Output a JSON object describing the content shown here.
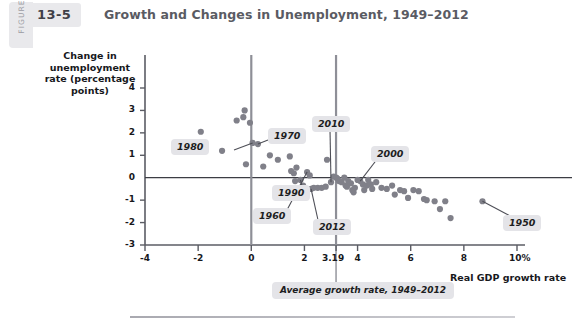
{
  "header": {
    "figure_word": "FIGURE",
    "figure_number": "13-5",
    "title": "Growth and Changes in Unemployment, 1949–2012"
  },
  "chart_data": {
    "type": "scatter",
    "title": "Growth and Changes in Unemployment, 1949–2012",
    "xlabel": "Real GDP growth rate",
    "ylabel": "Change in unemployment rate (percentage points)",
    "xlim": [
      -4,
      10
    ],
    "ylim": [
      -3,
      4.4
    ],
    "grid": false,
    "legend": "none",
    "xticks": [
      "-4",
      "-2",
      "0",
      "2",
      "3.19",
      "4",
      "6",
      "8",
      "10%"
    ],
    "xtick_values": [
      -4,
      -2,
      0,
      2,
      3.19,
      4,
      6,
      8,
      10
    ],
    "yticks": [
      "4",
      "3",
      "2",
      "1",
      "0",
      "-1",
      "-2",
      "-3"
    ],
    "ytick_values": [
      4,
      3,
      2,
      1,
      0,
      -1,
      -2,
      -3
    ],
    "point_color": "#808089",
    "reference_lines": [
      {
        "name": "zero-unemployment-change",
        "orientation": "horizontal",
        "value": 0
      },
      {
        "name": "zero-growth",
        "orientation": "vertical",
        "value": 0
      },
      {
        "name": "average-growth-rate",
        "orientation": "vertical",
        "value": 3.19
      }
    ],
    "annotations": [
      {
        "label": "1980",
        "x": 0.05,
        "y": 1.55
      },
      {
        "label": "1970",
        "x": 0.25,
        "y": 1.5
      },
      {
        "label": "2010",
        "x": 3.0,
        "y": -0.2
      },
      {
        "label": "2000",
        "x": 4.1,
        "y": -0.1
      },
      {
        "label": "1990",
        "x": 1.95,
        "y": 0.25
      },
      {
        "label": "1960",
        "x": 2.5,
        "y": 0.2
      },
      {
        "label": "2012",
        "x": 2.25,
        "y": -0.5
      },
      {
        "label": "1950",
        "x": 8.7,
        "y": -1.05
      },
      {
        "label": "Average growth rate, 1949–2012",
        "x": 3.19,
        "y": -3.0
      }
    ],
    "points": [
      [
        -1.9,
        2.05
      ],
      [
        -1.1,
        1.2
      ],
      [
        -0.55,
        2.55
      ],
      [
        -0.3,
        2.7
      ],
      [
        -0.25,
        3.0
      ],
      [
        -0.05,
        2.45
      ],
      [
        0.05,
        1.55
      ],
      [
        -0.2,
        0.6
      ],
      [
        0.25,
        1.5
      ],
      [
        0.45,
        0.5
      ],
      [
        0.7,
        1.0
      ],
      [
        1.0,
        0.8
      ],
      [
        1.45,
        0.95
      ],
      [
        1.5,
        0.3
      ],
      [
        1.6,
        0.2
      ],
      [
        1.65,
        -0.15
      ],
      [
        1.7,
        0.45
      ],
      [
        1.85,
        -0.1
      ],
      [
        1.95,
        -0.35
      ],
      [
        2.1,
        0.25
      ],
      [
        2.2,
        0.1
      ],
      [
        2.25,
        -0.5
      ],
      [
        2.35,
        -0.45
      ],
      [
        2.5,
        -0.45
      ],
      [
        2.65,
        -0.45
      ],
      [
        2.8,
        -0.4
      ],
      [
        2.85,
        0.8
      ],
      [
        3.0,
        -0.2
      ],
      [
        3.1,
        0.05
      ],
      [
        3.2,
        0.0
      ],
      [
        3.25,
        -0.05
      ],
      [
        3.3,
        -0.15
      ],
      [
        3.4,
        -0.2
      ],
      [
        3.5,
        0.0
      ],
      [
        3.55,
        -0.35
      ],
      [
        3.6,
        -0.4
      ],
      [
        3.65,
        -0.15
      ],
      [
        3.75,
        -0.25
      ],
      [
        3.8,
        -0.55
      ],
      [
        3.85,
        -0.65
      ],
      [
        3.9,
        -0.45
      ],
      [
        4.0,
        -0.1
      ],
      [
        4.1,
        -0.15
      ],
      [
        4.2,
        -0.3
      ],
      [
        4.25,
        -0.55
      ],
      [
        4.35,
        -0.35
      ],
      [
        4.4,
        -0.1
      ],
      [
        4.5,
        -0.3
      ],
      [
        4.55,
        -0.5
      ],
      [
        4.7,
        -0.2
      ],
      [
        4.9,
        -0.45
      ],
      [
        5.1,
        -0.5
      ],
      [
        5.3,
        -0.35
      ],
      [
        5.4,
        -0.75
      ],
      [
        5.6,
        -0.55
      ],
      [
        5.75,
        -0.6
      ],
      [
        5.9,
        -0.9
      ],
      [
        6.1,
        -0.55
      ],
      [
        6.3,
        -0.6
      ],
      [
        6.5,
        -0.95
      ],
      [
        6.6,
        -1.0
      ],
      [
        6.9,
        -1.05
      ],
      [
        7.1,
        -1.4
      ],
      [
        7.3,
        -1.05
      ],
      [
        7.5,
        -1.8
      ],
      [
        8.7,
        -1.05
      ]
    ]
  }
}
